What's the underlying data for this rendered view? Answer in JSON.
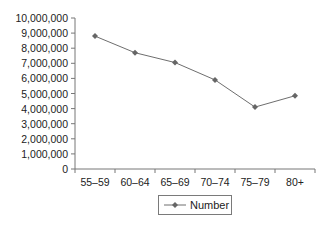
{
  "chart_data": {
    "type": "line",
    "title": "",
    "xlabel": "",
    "ylabel": "",
    "categories": [
      "55–59",
      "60–64",
      "65–69",
      "70–74",
      "75–79",
      "80+"
    ],
    "series": [
      {
        "name": "Number",
        "values": [
          8800000,
          7700000,
          7050000,
          5900000,
          4100000,
          4850000
        ],
        "color": "#6e6e6e",
        "marker": "diamond"
      }
    ],
    "ylim": [
      0,
      10000000
    ],
    "yticks": [
      0,
      1000000,
      2000000,
      3000000,
      4000000,
      5000000,
      6000000,
      7000000,
      8000000,
      9000000,
      10000000
    ],
    "ytick_labels": [
      "0",
      "1,000,000",
      "2,000,000",
      "3,000,000",
      "4,000,000",
      "5,000,000",
      "6,000,000",
      "7,000,000",
      "8,000,000",
      "9,000,000",
      "10,000,000"
    ],
    "grid": false,
    "legend_position": "bottom"
  },
  "legend": {
    "label": "Number"
  }
}
